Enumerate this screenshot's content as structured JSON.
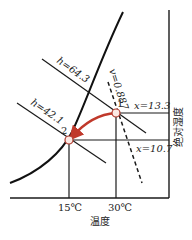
{
  "diagram": {
    "type": "psychrometric-chart",
    "x_axis": {
      "label": "温度",
      "ticks": [
        "15℃",
        "30℃"
      ]
    },
    "y_axis": {
      "label": "绝对湿度"
    },
    "lines": {
      "enthalpy_high": "h=64.3",
      "enthalpy_low": "h=42.1",
      "specific_volume": "v=0.887",
      "humidity_high": "x=13.3",
      "humidity_low": "x=10.7"
    },
    "points": [
      {
        "id": "1",
        "label": "1",
        "temp": "30℃",
        "x": "13.3",
        "h": "64.3"
      },
      {
        "id": "2",
        "label": "2",
        "temp": "15℃",
        "x": "10.7",
        "h": "42.1"
      }
    ],
    "process": {
      "from": "1",
      "to": "2",
      "color": "#c0392b"
    },
    "colors": {
      "line": "#1a1a1a",
      "arrow": "#c0392b",
      "point_fill": "#fbe9e4",
      "point_stroke": "#b03a2e"
    }
  }
}
